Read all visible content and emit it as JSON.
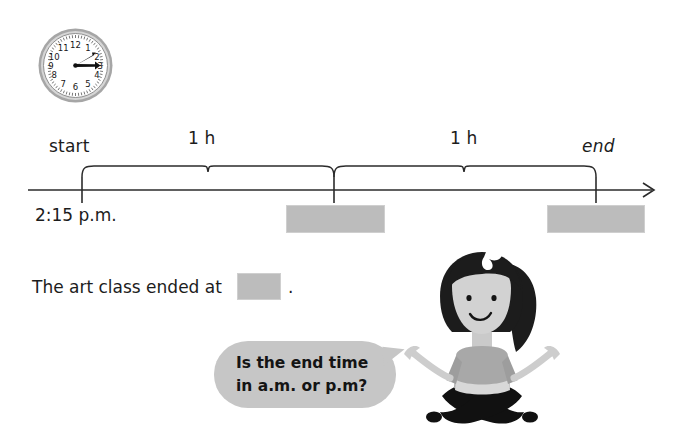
{
  "worksheet": {
    "clock": {
      "name": "analog-clock",
      "displayed_time": "2:15",
      "hour_numerals": [
        "12",
        "1",
        "2",
        "3",
        "4",
        "5",
        "6",
        "7",
        "8",
        "9",
        "10",
        "11"
      ],
      "hour_hand_points_to": 2,
      "minute_hand_points_to": 3,
      "face_color": "#ffffff",
      "bezel_color": "#9a9a9a"
    },
    "timeline": {
      "start_label": "start",
      "end_label": "end",
      "start_time": "2:15 p.m.",
      "intervals": [
        {
          "label": "1 h"
        },
        {
          "label": "1 h"
        }
      ],
      "tick_count": 3,
      "axis_color": "#2b2b2b",
      "blank_color": "#bcbcbc",
      "blanks": [
        {
          "name": "blank-mid",
          "value": ""
        },
        {
          "name": "blank-end",
          "value": ""
        }
      ]
    },
    "sentence": {
      "text": "The art class ended at",
      "blank_value": "",
      "period": "."
    },
    "speech_bubble": {
      "line1": "Is the end time",
      "line2": "in a.m. or p.m?",
      "fill_color": "#c6c6c6"
    },
    "character": {
      "name": "girl-sitting-cross-legged",
      "hair_color": "#1c1c1c",
      "skin_color": "#d0d0d0",
      "shirt_color": "#a8a8a8",
      "pants_color": "#111111",
      "bow_color": "#ffffff"
    }
  }
}
